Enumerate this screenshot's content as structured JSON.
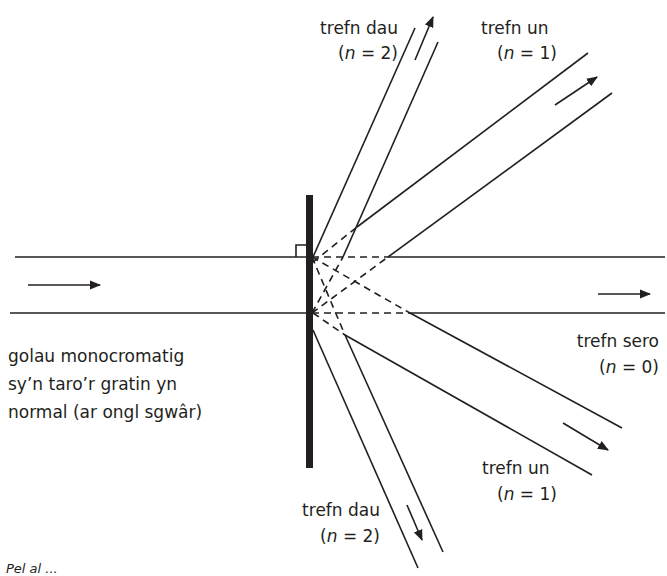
{
  "diagram": {
    "type": "diffraction-grating",
    "colors": {
      "line": "#231f20",
      "background": "#ffffff"
    },
    "incident": {
      "label_lines": [
        "golau monocromatig",
        "sy’n taro’r gratin yn",
        "normal (ar ongl sgwâr)"
      ]
    },
    "orders": {
      "n2_up": {
        "name": "trefn dau",
        "eq_n": "n",
        "eq_rest": " = 2)"
      },
      "n1_up": {
        "name": "trefn un",
        "eq_n": "n",
        "eq_rest": " = 1)"
      },
      "n0": {
        "name": "trefn sero",
        "eq_n": "n",
        "eq_rest": " = 0)"
      },
      "n1_down": {
        "name": "trefn un",
        "eq_n": "n",
        "eq_rest": " = 1)"
      },
      "n2_down": {
        "name": "trefn dau",
        "eq_n": "n",
        "eq_rest": " = 2)"
      }
    },
    "eq_open": "(",
    "caption": "Pel al ..."
  }
}
